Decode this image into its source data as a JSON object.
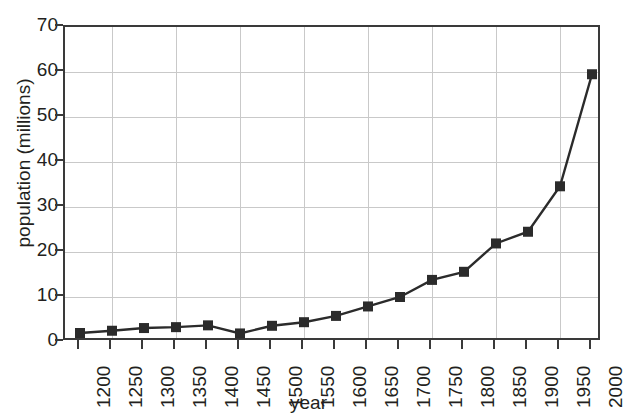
{
  "cut_off_text": "ital",
  "chart_data": {
    "type": "line",
    "title": "",
    "xlabel": "year",
    "ylabel": "population (millions)",
    "x": [
      1200,
      1250,
      1300,
      1350,
      1400,
      1450,
      1500,
      1550,
      1600,
      1650,
      1700,
      1750,
      1800,
      1850,
      1900,
      1950,
      2000
    ],
    "values": [
      2.0,
      2.5,
      3.1,
      3.3,
      3.7,
      1.9,
      3.6,
      4.4,
      5.8,
      7.9,
      10.0,
      13.8,
      15.6,
      21.9,
      24.5,
      34.6,
      59.5
    ],
    "xtick_labels": [
      "1200",
      "1250",
      "1300",
      "1350",
      "1400",
      "1450",
      "1500",
      "1550",
      "1600",
      "1650",
      "1700",
      "1750",
      "1800",
      "1850",
      "1900",
      "1950",
      "2000"
    ],
    "ytick_labels": [
      "0",
      "10",
      "20",
      "30",
      "40",
      "50",
      "60",
      "70"
    ],
    "ytick_values": [
      0,
      10,
      20,
      30,
      40,
      50,
      60,
      70
    ],
    "xlim": [
      1200,
      2000
    ],
    "ylim": [
      0,
      70
    ],
    "grid": true,
    "legend": "none",
    "marker": "square",
    "series_color": "#2b2b2b",
    "grid_color": "#c9c9c9",
    "axis_color": "#3a3a3a"
  }
}
